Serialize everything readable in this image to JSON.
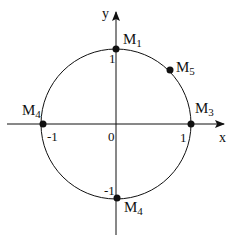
{
  "diagram": {
    "type": "unit-circle",
    "axes": {
      "x_label": "x",
      "y_label": "y",
      "origin_label": "0"
    },
    "ticks": {
      "x_pos": "1",
      "x_neg": "-1",
      "y_pos": "1",
      "y_neg": "-1"
    },
    "points": [
      {
        "name": "M1",
        "base": "M",
        "sub": "1",
        "coords": [
          0,
          1
        ]
      },
      {
        "name": "M5",
        "base": "M",
        "sub": "5",
        "coords": [
          0.707,
          0.707
        ]
      },
      {
        "name": "M3",
        "base": "M",
        "sub": "3",
        "coords": [
          1,
          0
        ]
      },
      {
        "name": "M4",
        "base": "M",
        "sub": "4",
        "coords": [
          -1,
          0
        ]
      },
      {
        "name": "M4",
        "base": "M",
        "sub": "4",
        "coords": [
          0,
          -1
        ]
      }
    ],
    "colors": {
      "stroke": "#111111",
      "background": "#ffffff"
    }
  }
}
